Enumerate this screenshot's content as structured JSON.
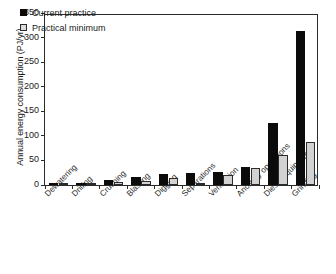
{
  "chart_data": {
    "type": "bar",
    "title": "",
    "xlabel": "",
    "ylabel": "Annual energy consumption (PJ/yr)",
    "ylim": [
      0,
      350
    ],
    "yticks": [
      0,
      50,
      100,
      150,
      200,
      250,
      300,
      350
    ],
    "ytick_labels": [
      "0",
      "50",
      "100",
      "150",
      "200",
      "250",
      "300",
      "350"
    ],
    "grid": false,
    "legend_position": "top-left",
    "categories": [
      "Dewatering",
      "Drilling",
      "Crushing",
      "Blasting",
      "Digging",
      "Separations",
      "Ventilation",
      "Ancillary operations",
      "Diesel equipment",
      "Grinding"
    ],
    "series": [
      {
        "name": "Current practice",
        "color": "#0b0b0b",
        "values": [
          3,
          4,
          10,
          17,
          23,
          24,
          26,
          36,
          127,
          314
        ]
      },
      {
        "name": "Practical minimum",
        "color": "#d2d2d2",
        "values": [
          3,
          3,
          6,
          8,
          14,
          4,
          20,
          35,
          61,
          88
        ]
      }
    ]
  },
  "legend": {
    "items": [
      {
        "label": "Current practice"
      },
      {
        "label": "Practical minimum"
      }
    ]
  }
}
